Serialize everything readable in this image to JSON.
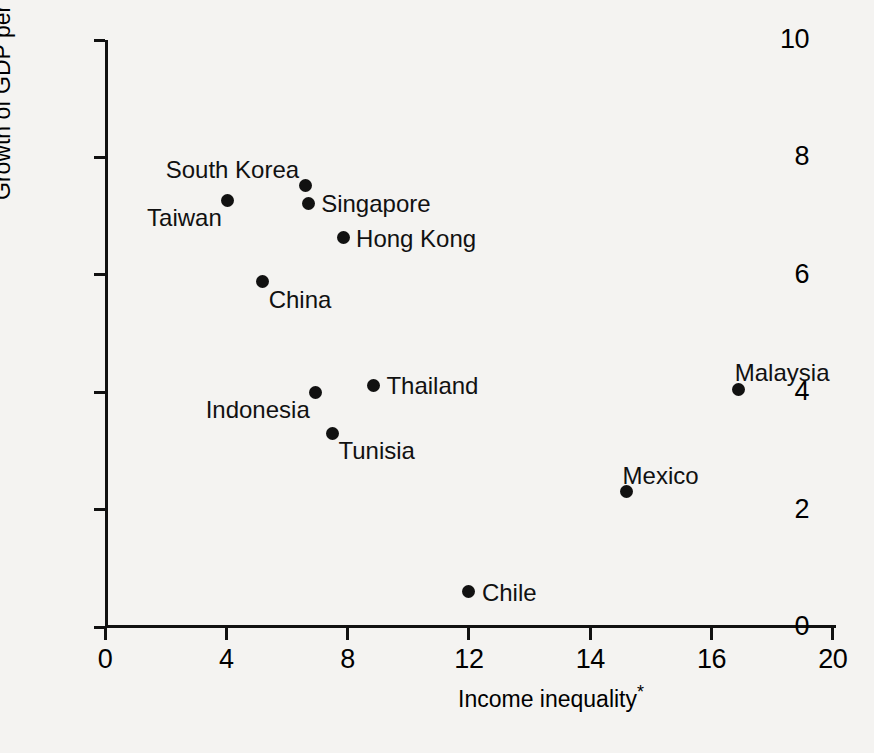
{
  "chart_data": {
    "type": "scatter",
    "title": "",
    "xlabel": "Income inequality*",
    "ylabel": "Growth of GDP per person",
    "xlim": [
      0,
      20
    ],
    "ylim": [
      0,
      10
    ],
    "grid": false,
    "legend": "none",
    "x_ticklabels": [
      "0",
      "4",
      "8",
      "12",
      "14",
      "16",
      "20"
    ],
    "y_ticklabels": [
      "0",
      "2",
      "4",
      "6",
      "8",
      "10"
    ],
    "x_tick_values": [
      0,
      4,
      8,
      12,
      14,
      16,
      20
    ],
    "y_tick_values": [
      0,
      2,
      4,
      6,
      8,
      10
    ],
    "points": [
      {
        "name": "South Korea",
        "x": 6.6,
        "y": 7.52,
        "label_pos": "above-left"
      },
      {
        "name": "Singapore",
        "x": 6.7,
        "y": 7.22,
        "label_pos": "right"
      },
      {
        "name": "Taiwan",
        "x": 4.05,
        "y": 7.27,
        "label_pos": "below-left"
      },
      {
        "name": "Hong Kong",
        "x": 7.85,
        "y": 6.63,
        "label_pos": "right"
      },
      {
        "name": "China",
        "x": 5.2,
        "y": 5.88,
        "label_pos": "below-right"
      },
      {
        "name": "Thailand",
        "x": 8.85,
        "y": 4.12,
        "label_pos": "right"
      },
      {
        "name": "Indonesia",
        "x": 6.95,
        "y": 4.0,
        "label_pos": "below-left"
      },
      {
        "name": "Tunisia",
        "x": 7.5,
        "y": 3.3,
        "label_pos": "below-right"
      },
      {
        "name": "Malaysia",
        "x": 16.9,
        "y": 4.05,
        "label_pos": "above-right"
      },
      {
        "name": "Mexico",
        "x": 14.6,
        "y": 2.3,
        "label_pos": "above-right"
      },
      {
        "name": "Chile",
        "x": 12.0,
        "y": 0.6,
        "label_pos": "right"
      }
    ],
    "colors": {
      "marker": "#111111",
      "axis": "#111111",
      "text": "#111111",
      "background": "#f4f3f1"
    }
  },
  "axes": {
    "y_title": "Growth of GDP per person",
    "x_title": "Income inequality",
    "x_title_footnote": "*"
  },
  "y_ticks": [
    {
      "label": "10",
      "value": 10
    },
    {
      "label": "8",
      "value": 8
    },
    {
      "label": "6",
      "value": 6
    },
    {
      "label": "4",
      "value": 4
    },
    {
      "label": "2",
      "value": 2
    },
    {
      "label": "0",
      "value": 0
    }
  ],
  "x_ticks": [
    {
      "label": "0",
      "index": 0
    },
    {
      "label": "4",
      "index": 1
    },
    {
      "label": "8",
      "index": 2
    },
    {
      "label": "12",
      "index": 3
    },
    {
      "label": "14",
      "index": 4
    },
    {
      "label": "16",
      "index": 5
    },
    {
      "label": "20",
      "index": 6
    }
  ],
  "series_labels": [
    "South Korea",
    "Singapore",
    "Taiwan",
    "Hong Kong",
    "China",
    "Thailand",
    "Indonesia",
    "Tunisia",
    "Malaysia",
    "Mexico",
    "Chile"
  ]
}
